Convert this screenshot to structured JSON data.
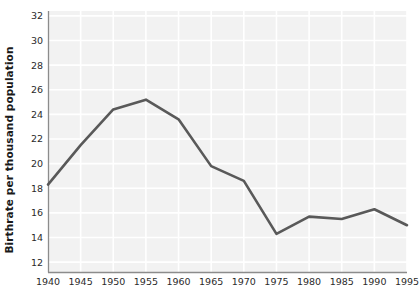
{
  "chart_data": {
    "type": "line",
    "title": "",
    "xlabel": "",
    "ylabel": "Birthrate per thousand population",
    "x": [
      1940,
      1945,
      1950,
      1955,
      1960,
      1965,
      1970,
      1975,
      1980,
      1985,
      1990,
      1995
    ],
    "values": [
      18.3,
      21.5,
      24.4,
      25.2,
      23.6,
      19.8,
      18.6,
      14.3,
      15.7,
      15.5,
      16.3,
      15.0
    ],
    "series": [
      {
        "name": "Birthrate",
        "values": [
          18.3,
          21.5,
          24.4,
          25.2,
          23.6,
          19.8,
          18.6,
          14.3,
          15.7,
          15.5,
          16.3,
          15.0
        ]
      }
    ],
    "xtick_labels": [
      "1940",
      "1945",
      "1950",
      "1955",
      "1960",
      "1965",
      "1970",
      "1975",
      "1980",
      "1985",
      "1990",
      "1995"
    ],
    "ytick_labels": [
      "12",
      "14",
      "16",
      "18",
      "20",
      "22",
      "24",
      "26",
      "28",
      "30",
      "32"
    ],
    "yticks": [
      12,
      14,
      16,
      18,
      20,
      22,
      24,
      26,
      28,
      30,
      32
    ],
    "xlim": [
      1940,
      1995
    ],
    "ylim": [
      11.2,
      32.4
    ],
    "grid": true,
    "legend": null,
    "colors": {
      "line": "#595959",
      "plot_background": "#f2f2f2",
      "gridline": "#ffffff",
      "axis": "#8c8c8c",
      "text": "#1a1a1a"
    }
  }
}
